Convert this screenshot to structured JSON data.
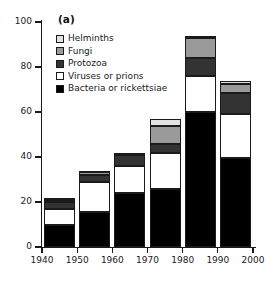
{
  "figure": {
    "panel_label": "(a)"
  },
  "legend": {
    "position": "upper-left-inside",
    "entries": [
      {
        "label": "Helminths",
        "color": "#e2e2e2"
      },
      {
        "label": "Fungi",
        "color": "#9a9a9a"
      },
      {
        "label": "Protozoa",
        "color": "#333333"
      },
      {
        "label": "Viruses or prions",
        "color": "#ffffff"
      },
      {
        "label": "Bacteria or rickettsiae",
        "color": "#000000"
      }
    ]
  },
  "axes": {
    "y_ticks": [
      0,
      20,
      40,
      60,
      80,
      100
    ],
    "y_tick_labels": [
      "0",
      "20",
      "40",
      "60",
      "80",
      "100"
    ],
    "x_ticks": [
      1940,
      1950,
      1960,
      1970,
      1980,
      1990,
      2000
    ],
    "x_tick_labels": [
      "1940",
      "1950",
      "1960",
      "1970",
      "1980",
      "1990",
      "2000"
    ]
  },
  "chart_data": {
    "type": "bar",
    "stacked": true,
    "title": "",
    "subtitle": "",
    "xlabel": "",
    "ylabel": "",
    "xlim": [
      1935,
      2002
    ],
    "ylim": [
      0,
      100
    ],
    "grid": false,
    "annotations": [
      "(a)"
    ],
    "categories": [
      "1940",
      "1950",
      "1960",
      "1970",
      "1980",
      "1990"
    ],
    "bar_spans": [
      [
        1940,
        1950
      ],
      [
        1950,
        1960
      ],
      [
        1960,
        1970
      ],
      [
        1970,
        1980
      ],
      [
        1980,
        1990
      ],
      [
        1990,
        2000
      ]
    ],
    "series": [
      {
        "name": "Bacteria or rickettsiae",
        "color": "#000000",
        "values": [
          10,
          15.5,
          24,
          26,
          60,
          39.5
        ]
      },
      {
        "name": "Viruses or prions",
        "color": "#ffffff",
        "values": [
          7,
          13.5,
          12,
          16,
          16,
          19.5
        ]
      },
      {
        "name": "Protozoa",
        "color": "#333333",
        "values": [
          3,
          3,
          5,
          4,
          8,
          9.5
        ]
      },
      {
        "name": "Fungi",
        "color": "#9a9a9a",
        "values": [
          1,
          1.5,
          0.5,
          8,
          9,
          4
        ]
      },
      {
        "name": "Helminths",
        "color": "#e2e2e2",
        "values": [
          1,
          0.5,
          0.5,
          3,
          1,
          1.5
        ]
      }
    ],
    "totals": [
      22,
      34,
      42,
      57,
      94,
      74
    ]
  }
}
